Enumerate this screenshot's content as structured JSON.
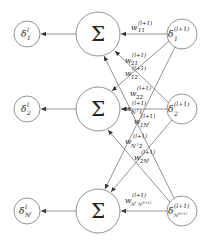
{
  "diagram": {
    "left_nodes": [
      {
        "symbol": "δ",
        "sup": "l",
        "sub": "1"
      },
      {
        "symbol": "δ",
        "sup": "l",
        "sub": "2"
      },
      {
        "symbol": "δ",
        "sup": "l",
        "sub": "N^l"
      }
    ],
    "sum_nodes": [
      {
        "symbol": "Σ"
      },
      {
        "symbol": "Σ"
      },
      {
        "symbol": "Σ"
      }
    ],
    "right_nodes": [
      {
        "symbol": "δ",
        "sup": "(l+1)",
        "sub": "1"
      },
      {
        "symbol": "δ",
        "sup": "(l+1)",
        "sub": "2"
      },
      {
        "symbol": "δ",
        "sup": "(l+1)",
        "sub": "N^(l+1)"
      }
    ],
    "weights": [
      {
        "w": "w",
        "sup": "(l+1)",
        "sub": "11"
      },
      {
        "w": "w",
        "sup": "(l+1)",
        "sub": "21"
      },
      {
        "w": "w",
        "sup": "(l+1)",
        "sub": "12"
      },
      {
        "w": "w",
        "sup": "(l+1)",
        "sub": "22"
      },
      {
        "w": "w",
        "sup": "(l+1)",
        "sub": "N^l 1"
      },
      {
        "w": "w",
        "sup": "(l+1)",
        "sub": "1N^l"
      },
      {
        "w": "w",
        "sup": "(l+1)",
        "sub": "N^l 2"
      },
      {
        "w": "w",
        "sup": "(l+1)",
        "sub": "2N^l"
      },
      {
        "w": "w",
        "sup": "(l+1)",
        "sub": "N^l N^(l+1)"
      }
    ]
  }
}
